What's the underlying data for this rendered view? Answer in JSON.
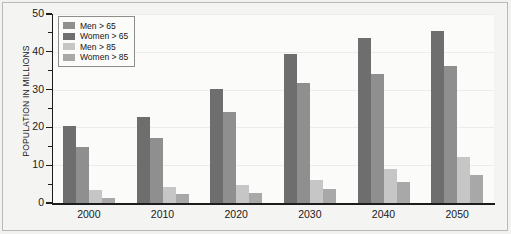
{
  "chart_data": {
    "type": "bar",
    "title": "",
    "xlabel": "",
    "ylabel": "POPULATION IN MILLIONS",
    "categories": [
      "2000",
      "2010",
      "2020",
      "2030",
      "2040",
      "2050"
    ],
    "ylim": [
      0,
      50
    ],
    "ytick_labels": [
      "0",
      "10",
      "20",
      "30",
      "40",
      "50"
    ],
    "ytick_values": [
      0,
      10,
      20,
      30,
      40,
      50
    ],
    "yminor_values": [
      5,
      15,
      25,
      35,
      45
    ],
    "grid": true,
    "legend_position": "upper-left",
    "series": [
      {
        "name": "Men > 65",
        "color": "#6e6e6e",
        "values": [
          20.5,
          22.7,
          30.1,
          39.3,
          43.6,
          45.6
        ]
      },
      {
        "name": "Women > 65",
        "color": "#8f8f8f",
        "values": [
          14.7,
          17.1,
          24.1,
          31.8,
          34.2,
          36.2
        ]
      },
      {
        "name": "Men > 85",
        "color": "#c6c6c6",
        "values": [
          3.4,
          4.3,
          4.7,
          6.0,
          9.1,
          12.3
        ]
      },
      {
        "name": "Women > 85",
        "color": "#a8a8a8",
        "values": [
          1.2,
          2.3,
          2.7,
          3.8,
          5.6,
          7.4
        ]
      }
    ],
    "legend_swatch_colors": [
      "#8f8f8f",
      "#6e6e6e",
      "#c6c6c6",
      "#a8a8a8"
    ]
  }
}
